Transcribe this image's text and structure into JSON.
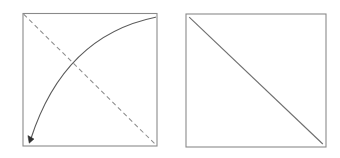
{
  "figure": {
    "title": "",
    "background_color": "#ffffff",
    "width": 340,
    "height": 158,
    "panel_count": 2,
    "panels": [
      {
        "name": "left-panel",
        "label": "",
        "frame": {
          "x": 23.0,
          "y": 13.5,
          "width": 134.0,
          "height": 132.5,
          "stroke_color": "#8a8a8a",
          "fill_color": "#ffffff",
          "stroke_width": 1.1
        },
        "elements": [
          {
            "name": "dashed-anti-diagonal",
            "style": "dashed",
            "stroke_color": "#8d8d8d",
            "dash_pattern": "4.6 3.2",
            "from": {
              "x": 23.0,
              "y": 13.5
            },
            "to": {
              "x": 157.0,
              "y": 146.0
            }
          },
          {
            "name": "solid-curved-arrow",
            "style": "solid-curve",
            "stroke_color": "#5b5b5b",
            "has_arrowhead": true,
            "arrowhead_at": "start",
            "from": {
              "x": 30.5,
              "y": 139.5
            },
            "control": {
              "x": 64.0,
              "y": 36.0
            },
            "to": {
              "x": 155.5,
              "y": 17.0
            },
            "concavity": "down"
          }
        ]
      },
      {
        "name": "right-panel",
        "label": "",
        "frame": {
          "x": 186.0,
          "y": 14.0,
          "width": 140.0,
          "height": 133.0,
          "stroke_color": "#8a8a8a",
          "fill_color": "#ffffff",
          "stroke_width": 1.1
        },
        "elements": [
          {
            "name": "solid-main-diagonal",
            "style": "solid",
            "stroke_color": "#6e6e6e",
            "has_arrowhead": false,
            "from": {
              "x": 189.0,
              "y": 17.0
            },
            "to": {
              "x": 323.0,
              "y": 144.0
            }
          }
        ]
      }
    ]
  }
}
